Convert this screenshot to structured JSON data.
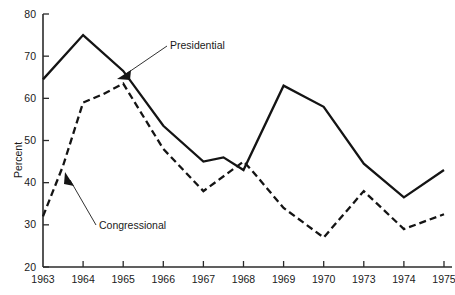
{
  "chart_data": {
    "type": "line",
    "title": "",
    "xlabel": "",
    "ylabel": "Percent",
    "xlim": [
      1963,
      1975
    ],
    "ylim": [
      20,
      80
    ],
    "grid": false,
    "legend_position": "inline-annotations",
    "categories": [
      "1963",
      "1964",
      "1965",
      "1966",
      "1967",
      "1968",
      "1969",
      "1970",
      "1973",
      "1974",
      "1975"
    ],
    "xtick_labels": [
      "1963",
      "1964",
      "1965",
      "1966",
      "1967",
      "1968",
      "1969",
      "1970",
      "1973",
      "1974",
      "1975"
    ],
    "ytick_labels": [
      "20",
      "30",
      "40",
      "50",
      "60",
      "70",
      "80"
    ],
    "ytick_values": [
      20,
      30,
      40,
      50,
      60,
      70,
      80
    ],
    "series": [
      {
        "name": "Presidential",
        "style": "solid",
        "values": [
          64.5,
          75,
          66.5,
          53.5,
          45,
          43,
          63,
          58,
          44.5,
          36.5,
          43
        ],
        "points": [
          {
            "x": "1963",
            "y": 64.5
          },
          {
            "x": "1964",
            "y": 75
          },
          {
            "x": "1965",
            "y": 66.5
          },
          {
            "x": "1966",
            "y": 53.5
          },
          {
            "x": "1967",
            "y": 45
          },
          {
            "x": "1967.5",
            "y": 46
          },
          {
            "x": "1968",
            "y": 43
          },
          {
            "x": "1969",
            "y": 63
          },
          {
            "x": "1969.5",
            "y": 60.5
          },
          {
            "x": "1970",
            "y": 58
          },
          {
            "x": "1973",
            "y": 44.5
          },
          {
            "x": "1974",
            "y": 36.5
          },
          {
            "x": "1975",
            "y": 43
          }
        ]
      },
      {
        "name": "Congressional",
        "style": "dashed",
        "values": [
          32,
          63.5,
          63.5,
          48,
          38,
          45,
          34,
          27,
          38,
          29,
          32.5
        ],
        "points": [
          {
            "x": "1963",
            "y": 32
          },
          {
            "x": "1963.5",
            "y": 44
          },
          {
            "x": "1964",
            "y": 59
          },
          {
            "x": "1964.5",
            "y": 61
          },
          {
            "x": "1965",
            "y": 63.5
          },
          {
            "x": "1966",
            "y": 48
          },
          {
            "x": "1967",
            "y": 38
          },
          {
            "x": "1968",
            "y": 45
          },
          {
            "x": "1968.2",
            "y": 43
          },
          {
            "x": "1969",
            "y": 34
          },
          {
            "x": "1970",
            "y": 27
          },
          {
            "x": "1973",
            "y": 38
          },
          {
            "x": "1974",
            "y": 29
          },
          {
            "x": "1975",
            "y": 32.5
          }
        ]
      }
    ],
    "annotations": [
      {
        "text": "Presidential",
        "points_to_series": "Presidential",
        "arrow": true
      },
      {
        "text": "Congressional",
        "points_to_series": "Congressional",
        "arrow": true
      }
    ],
    "colors": {
      "ink": "#141414",
      "axis": "#2b2b2b",
      "background": "#ffffff"
    }
  }
}
